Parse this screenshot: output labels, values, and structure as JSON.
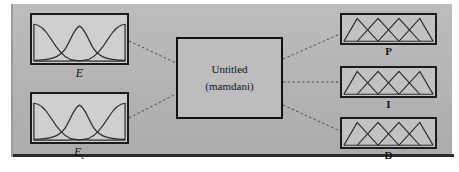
{
  "diagram": {
    "type": "fis-editor-structure",
    "background_color": "#b5b5b5",
    "system": {
      "name": "Untitled",
      "inference_type": "(mamdani)",
      "box_fill": "#bdbdbd",
      "box_stroke": "#111111"
    },
    "inputs": [
      {
        "id": "E",
        "label": "E",
        "label_base": "E",
        "label_sub": "",
        "mf_type": "gaussian",
        "mf_count": 3,
        "mf_centers": [
          0.14,
          0.5,
          0.86
        ],
        "mf_sigma": 0.13
      },
      {
        "id": "Ec",
        "label": "Ec",
        "label_base": "E",
        "label_sub": "c",
        "mf_type": "gaussian",
        "mf_count": 3,
        "mf_centers": [
          0.14,
          0.5,
          0.86
        ],
        "mf_sigma": 0.13
      }
    ],
    "outputs": [
      {
        "id": "P",
        "label": "P",
        "mf_type": "triangular",
        "mf_count": 4,
        "mf_centers": [
          0.15,
          0.38,
          0.62,
          0.85
        ],
        "mf_half_width": 0.23
      },
      {
        "id": "I",
        "label": "I",
        "mf_type": "triangular",
        "mf_count": 4,
        "mf_centers": [
          0.15,
          0.38,
          0.62,
          0.85
        ],
        "mf_half_width": 0.23
      },
      {
        "id": "D",
        "label": "D",
        "mf_type": "triangular",
        "mf_count": 4,
        "mf_centers": [
          0.15,
          0.38,
          0.62,
          0.85
        ],
        "mf_half_width": 0.23
      }
    ],
    "connections": [
      {
        "from": "E",
        "to": "system",
        "style": "dashed"
      },
      {
        "from": "Ec",
        "to": "system",
        "style": "dashed"
      },
      {
        "from": "system",
        "to": "P",
        "style": "dashed"
      },
      {
        "from": "system",
        "to": "I",
        "style": "dashed"
      },
      {
        "from": "system",
        "to": "D",
        "style": "dashed"
      }
    ]
  }
}
